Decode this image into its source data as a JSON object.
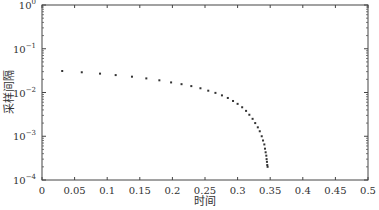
{
  "chart_data": {
    "type": "scatter",
    "title": "",
    "xlabel": "时间",
    "ylabel": "采样间隔",
    "xlim": [
      0,
      0.5
    ],
    "ylim": [
      0.0001,
      1
    ],
    "yscale": "log",
    "grid": false,
    "legend": null,
    "x_ticks": [
      "0",
      "0.05",
      "0.1",
      "0.15",
      "0.2",
      "0.25",
      "0.3",
      "0.35",
      "0.4",
      "0.45",
      "0.5"
    ],
    "x_tick_values": [
      0,
      0.05,
      0.1,
      0.15,
      0.2,
      0.25,
      0.3,
      0.35,
      0.4,
      0.45,
      0.5
    ],
    "y_ticks": [
      "10^0",
      "10^-1",
      "10^-2",
      "10^-3",
      "10^-4"
    ],
    "y_tick_exponents": [
      0,
      -1,
      -2,
      -3,
      -4
    ],
    "marker": "dot",
    "marker_color": "#333333",
    "series": [
      {
        "name": "采样间隔",
        "x": [
          0.031,
          0.061,
          0.089,
          0.113,
          0.138,
          0.16,
          0.18,
          0.198,
          0.214,
          0.229,
          0.243,
          0.255,
          0.266,
          0.276,
          0.285,
          0.293,
          0.3,
          0.307,
          0.313,
          0.318,
          0.323,
          0.327,
          0.331,
          0.334,
          0.337,
          0.339,
          0.341,
          0.342,
          0.343,
          0.344,
          0.3445,
          0.345,
          0.3455,
          0.346
        ],
        "y": [
          0.031,
          0.029,
          0.027,
          0.025,
          0.023,
          0.021,
          0.019,
          0.017,
          0.0155,
          0.014,
          0.0125,
          0.011,
          0.0098,
          0.0086,
          0.0075,
          0.0064,
          0.0055,
          0.0046,
          0.0038,
          0.0031,
          0.0025,
          0.002,
          0.0016,
          0.0013,
          0.001,
          0.0008,
          0.00065,
          0.00052,
          0.00043,
          0.00036,
          0.0003,
          0.00026,
          0.00022,
          0.0002
        ]
      }
    ]
  }
}
